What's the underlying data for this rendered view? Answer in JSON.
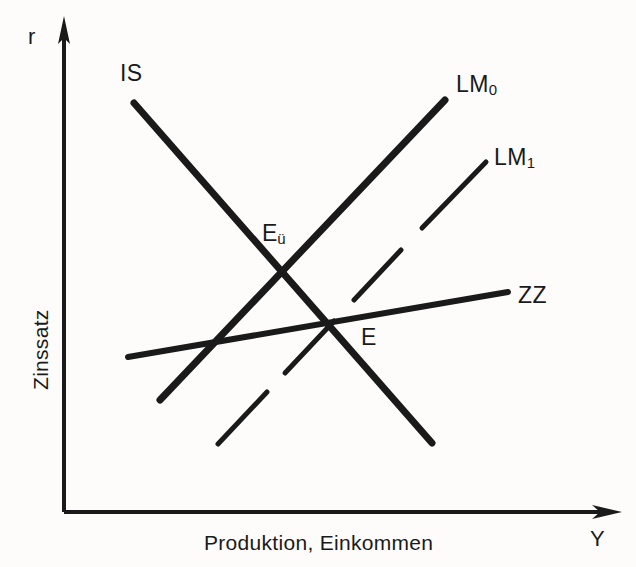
{
  "figure": {
    "kind": "is-lm-zz-diagram",
    "background_color": "#fdfcfa",
    "ink_color": "#1a1a1a",
    "axes": {
      "y_axis_label": "Zinssatz",
      "y_axis_variable": "r",
      "x_axis_label": "Produktion, Einkommen",
      "x_axis_variable": "Y",
      "origin": [
        64,
        512
      ],
      "y_top": [
        64,
        18
      ],
      "x_right": [
        620,
        512
      ]
    },
    "curves": [
      {
        "name": "IS",
        "label": "IS",
        "style": "solid",
        "stroke_width": 7,
        "from": [
          134,
          103
        ],
        "to": [
          432,
          443
        ],
        "label_pos": [
          120,
          62
        ]
      },
      {
        "name": "LM0",
        "label": "LM",
        "sublabel": "0",
        "style": "solid",
        "stroke_width": 7,
        "from": [
          160,
          400
        ],
        "to": [
          445,
          100
        ],
        "label_pos": [
          456,
          73
        ]
      },
      {
        "name": "LM1",
        "label": "LM",
        "sublabel": "1",
        "style": "dashed",
        "stroke_width": 5,
        "from": [
          218,
          444
        ],
        "to": [
          485,
          163
        ],
        "label_pos": [
          494,
          146
        ]
      },
      {
        "name": "ZZ",
        "label": "ZZ",
        "style": "solid",
        "stroke_width": 6,
        "from": [
          128,
          357
        ],
        "to": [
          508,
          292
        ],
        "label_pos": [
          518,
          284
        ]
      }
    ],
    "points": [
      {
        "name": "E-ue",
        "label": "E",
        "sublabel": "ü",
        "pos": [
          283,
          268
        ],
        "label_pos": [
          262,
          222
        ]
      },
      {
        "name": "E",
        "label": "E",
        "pos": [
          330,
          323
        ],
        "label_pos": [
          361,
          326
        ]
      }
    ]
  }
}
